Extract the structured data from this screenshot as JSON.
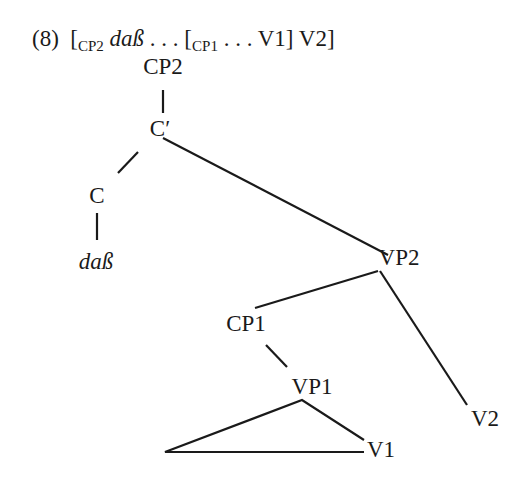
{
  "example": {
    "number": "(8)",
    "bracket_open": "[",
    "cp2_sub": "CP2",
    "dass": "daß",
    "dots1": " . . . [",
    "cp1_sub": "CP1",
    "dots2": " . . . V1] V2]"
  },
  "tree": {
    "nodes": {
      "cp2": "CP2",
      "cbar": "C′",
      "c": "C",
      "dass": "daß",
      "vp2": "VP2",
      "cp1": "CP1",
      "vp1": "VP1",
      "v1": "V1",
      "v2": "V2"
    }
  }
}
